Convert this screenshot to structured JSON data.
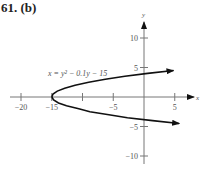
{
  "title": "61. (b)",
  "chart_data": {
    "type": "line",
    "title": "61. (b)",
    "xlabel": "x",
    "ylabel": "y",
    "xlim": [
      -22,
      7
    ],
    "ylim": [
      -12,
      13
    ],
    "grid": false,
    "x_ticks": [
      -20,
      -15,
      -10,
      -5,
      5
    ],
    "x_tick_labels": [
      "−20",
      "−15",
      "",
      "−5",
      "5"
    ],
    "y_ticks": [
      10,
      5,
      -5,
      -10
    ],
    "y_tick_labels": [
      "10",
      "5",
      "−5",
      "−10"
    ],
    "series": [
      {
        "name": "x = y² − 0.1y − 15",
        "equation": "x = y^2 - 0.1y - 15",
        "y_range": [
          -4.5,
          4.6
        ],
        "points": [
          {
            "x": 5.7,
            "y": -4.5
          },
          {
            "x": 1.4,
            "y": -4
          },
          {
            "x": -2.7,
            "y": -3.5
          },
          {
            "x": -5.7,
            "y": -3
          },
          {
            "x": -8.8,
            "y": -2.5
          },
          {
            "x": -10.6,
            "y": -2
          },
          {
            "x": -12.6,
            "y": -1.5
          },
          {
            "x": -13.9,
            "y": -1
          },
          {
            "x": -14.7,
            "y": -0.5
          },
          {
            "x": -15,
            "y": 0
          },
          {
            "x": -14.8,
            "y": 0.5
          },
          {
            "x": -14.1,
            "y": 1
          },
          {
            "x": -12.9,
            "y": 1.5
          },
          {
            "x": -11.2,
            "y": 2
          },
          {
            "x": -9,
            "y": 2.5
          },
          {
            "x": -6.3,
            "y": 3
          },
          {
            "x": -3.1,
            "y": 3.5
          },
          {
            "x": 0.6,
            "y": 4
          },
          {
            "x": 4.8,
            "y": 4.5
          }
        ]
      }
    ],
    "annotations": [
      {
        "text": "x = y² − 0.1y − 15",
        "near": [
          -13,
          6
        ]
      }
    ]
  }
}
